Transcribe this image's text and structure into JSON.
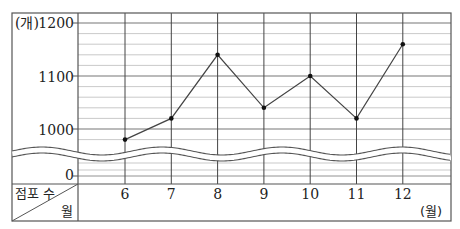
{
  "chart_data": {
    "type": "line",
    "title": "",
    "xlabel": "월",
    "ylabel": "점포 수",
    "x_unit": "(월)",
    "y_unit": "(개)",
    "categories": [
      "6",
      "7",
      "8",
      "9",
      "10",
      "11",
      "12"
    ],
    "values": [
      980,
      1020,
      1140,
      1040,
      1100,
      1020,
      1160
    ],
    "yticks": [
      "0",
      "1000",
      "1100",
      "1200"
    ],
    "ylim": [
      960,
      1200
    ],
    "y_break": true,
    "grid": true,
    "minor_step": 20,
    "legend": null
  },
  "labels": {
    "y_unit": "(개)",
    "y_1200": "1200",
    "y_1100": "1100",
    "y_1000": "1000",
    "y_0": "0",
    "header_top": "점포 수",
    "header_bottom": "월",
    "x_unit": "(월)"
  },
  "colors": {
    "line": "#444444",
    "grid": "#bbbbbb",
    "frame": "#555555"
  }
}
